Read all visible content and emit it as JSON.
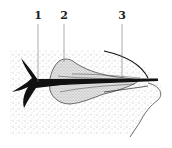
{
  "figure": {
    "type": "anatomical-cross-section",
    "labels": [
      {
        "id": "1",
        "text": "1",
        "x": 38
      },
      {
        "id": "2",
        "text": "2",
        "x": 64
      },
      {
        "id": "3",
        "text": "3",
        "x": 122
      }
    ]
  },
  "colors": {
    "background": "#ffffff",
    "ink": "#111111",
    "stipple": "#6a6a6a",
    "lobe_fill": "#d9d9d9",
    "leader": "#777777"
  }
}
